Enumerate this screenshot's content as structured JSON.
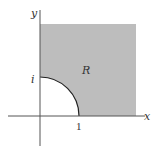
{
  "diagram": {
    "type": "region-in-plane",
    "colors": {
      "region_fill": "#bdbdbd",
      "axis": "#555555",
      "arc": "#222222",
      "background": "#ffffff"
    },
    "labels": {
      "x_axis": "x",
      "y_axis": "y",
      "region": "R",
      "x_tick": "1",
      "y_tick": "i"
    }
  }
}
